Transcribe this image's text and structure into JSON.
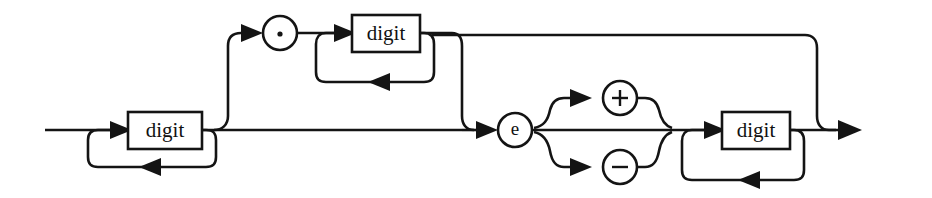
{
  "diagram": {
    "kind": "railroad-syntax-diagram",
    "background_color": "#ffffff",
    "line_color": "#141414",
    "nodes": [
      {
        "id": "digit-int",
        "type": "box",
        "label": "digit",
        "x": 165,
        "y": 130
      },
      {
        "id": "dot",
        "type": "circle",
        "label": ".",
        "x": 280,
        "y": 33
      },
      {
        "id": "digit-frac",
        "type": "box",
        "label": "digit",
        "x": 386,
        "y": 33
      },
      {
        "id": "exponent-e",
        "type": "circle",
        "label": "e",
        "x": 515,
        "y": 130
      },
      {
        "id": "sign-plus",
        "type": "circle",
        "label": "+",
        "x": 620,
        "y": 98
      },
      {
        "id": "sign-minus",
        "type": "circle",
        "label": "−",
        "x": 620,
        "y": 167
      },
      {
        "id": "digit-exp",
        "type": "box",
        "label": "digit",
        "x": 756,
        "y": 130
      }
    ],
    "labels": {
      "digit": "digit",
      "dot": ".",
      "e": "e",
      "plus": "+",
      "minus": "−"
    },
    "entry": {
      "x": 45,
      "y": 130
    },
    "exit": {
      "x": 862,
      "y": 130
    },
    "loops": [
      {
        "id": "loop-int",
        "repeats": "digit"
      },
      {
        "id": "loop-frac",
        "repeats": "digit"
      },
      {
        "id": "loop-exp",
        "repeats": "digit"
      }
    ],
    "branches": [
      {
        "id": "skip-fraction-and-exponent"
      },
      {
        "id": "skip-sign"
      }
    ]
  }
}
